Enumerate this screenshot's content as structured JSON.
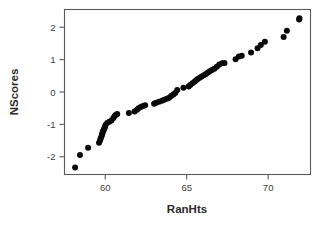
{
  "chart_data": {
    "type": "scatter",
    "title": "",
    "subtitle": "",
    "xlabel": "RanHts",
    "ylabel": "NScores",
    "xlim": [
      57.5,
      72.6
    ],
    "ylim": [
      -2.55,
      2.55
    ],
    "xticks": [
      60,
      65,
      70
    ],
    "xticklabels": [
      "60",
      "65",
      "70"
    ],
    "yticks": [
      -2,
      -1,
      0,
      1,
      2
    ],
    "yticklabels": [
      "-2",
      "-1",
      "0",
      "1",
      "2"
    ],
    "grid": false,
    "legend": null,
    "legend_position": "none",
    "marker": "filled-circle",
    "marker_color": "#0a0a0a",
    "marker_size_px": 3.0,
    "frame_color": "#5a5a5a",
    "background_color": "#ffffff",
    "n_points": 70,
    "series": [
      {
        "name": "NScores vs RanHts",
        "x": [
          58.15,
          58.45,
          58.95,
          59.62,
          59.68,
          59.72,
          59.76,
          59.8,
          59.82,
          59.85,
          59.88,
          59.92,
          59.95,
          59.98,
          60.02,
          60.12,
          60.25,
          60.38,
          60.5,
          60.58,
          60.66,
          60.74,
          61.45,
          61.8,
          61.95,
          62.05,
          62.18,
          62.32,
          62.45,
          63.0,
          63.12,
          63.3,
          63.48,
          63.62,
          63.78,
          63.92,
          64.05,
          64.18,
          64.3,
          64.42,
          64.8,
          65.12,
          65.22,
          65.35,
          65.48,
          65.58,
          65.68,
          65.8,
          65.92,
          66.05,
          66.18,
          66.3,
          66.42,
          66.55,
          66.7,
          66.85,
          67.0,
          67.18,
          67.32,
          68.0,
          68.2,
          68.38,
          68.95,
          69.35,
          69.55,
          69.8,
          70.95,
          71.15,
          71.9,
          71.92
        ],
        "y": [
          -2.33,
          -1.95,
          -1.72,
          -1.57,
          -1.5,
          -1.44,
          -1.38,
          -1.33,
          -1.28,
          -1.24,
          -1.2,
          -1.16,
          -1.12,
          -1.08,
          -1.02,
          -0.96,
          -0.92,
          -0.88,
          -0.8,
          -0.74,
          -0.7,
          -0.68,
          -0.65,
          -0.6,
          -0.55,
          -0.5,
          -0.46,
          -0.43,
          -0.41,
          -0.36,
          -0.33,
          -0.3,
          -0.27,
          -0.24,
          -0.21,
          -0.18,
          -0.12,
          -0.08,
          -0.03,
          0.06,
          0.13,
          0.17,
          0.22,
          0.27,
          0.32,
          0.36,
          0.4,
          0.44,
          0.48,
          0.52,
          0.56,
          0.6,
          0.64,
          0.68,
          0.72,
          0.78,
          0.85,
          0.89,
          0.9,
          1.01,
          1.1,
          1.12,
          1.22,
          1.35,
          1.45,
          1.55,
          1.7,
          1.89,
          2.24,
          2.28
        ]
      }
    ]
  },
  "axes": {
    "x_title": "RanHts",
    "y_title": "NScores"
  }
}
